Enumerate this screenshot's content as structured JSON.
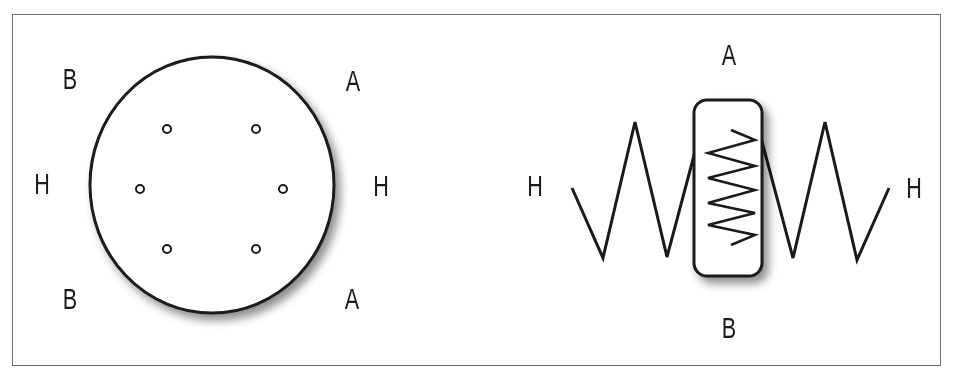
{
  "colors": {
    "stroke": "#1a1a1a",
    "frame": "#6e6e6e",
    "background": "#ffffff"
  },
  "left_panel": {
    "labels": {
      "top_left": "B",
      "top_right": "A",
      "mid_left": "H",
      "mid_right": "H",
      "bottom_left": "B",
      "bottom_right": "A"
    },
    "shape": "circle-with-six-small-rings"
  },
  "right_panel": {
    "labels": {
      "top": "A",
      "bottom": "B",
      "left": "H",
      "right": "H"
    },
    "shape": "springs-with-rounded-box-and-inner-coil"
  }
}
